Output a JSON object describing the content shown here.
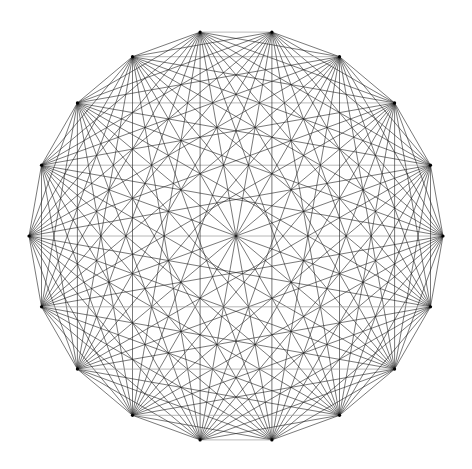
{
  "figure": {
    "kind": "complete-graph",
    "title": "",
    "caption": "",
    "background_color": "#ffffff",
    "width": 472,
    "height": 469
  },
  "chart_data": {
    "type": "scatter",
    "title": "",
    "subtitle": "",
    "xlabel": "",
    "ylabel": "",
    "grid": false,
    "legend": null,
    "annotations": [],
    "graph": {
      "name": "K18",
      "vertex_count": 18,
      "edge_count": 153,
      "layout": "circular",
      "complete": true,
      "center_x": 236,
      "center_y": 236,
      "radius": 207,
      "start_angle_deg": 0,
      "angle_step_deg": 20,
      "angles_deg": [
        0,
        20,
        40,
        60,
        80,
        100,
        120,
        140,
        160,
        180,
        200,
        220,
        240,
        260,
        280,
        300,
        320,
        340
      ],
      "vertex_labels": [
        "0",
        "1",
        "2",
        "3",
        "4",
        "5",
        "6",
        "7",
        "8",
        "9",
        "10",
        "11",
        "12",
        "13",
        "14",
        "15",
        "16",
        "17"
      ],
      "vertices": [
        {
          "id": 0,
          "angle_deg": 0,
          "x": 443.0,
          "y": 236.0
        },
        {
          "id": 1,
          "angle_deg": 20,
          "x": 430.5,
          "y": 165.2
        },
        {
          "id": 2,
          "angle_deg": 40,
          "x": 394.6,
          "y": 102.9
        },
        {
          "id": 3,
          "angle_deg": 60,
          "x": 339.5,
          "y": 56.7
        },
        {
          "id": 4,
          "angle_deg": 80,
          "x": 271.9,
          "y": 32.1
        },
        {
          "id": 5,
          "angle_deg": 100,
          "x": 200.1,
          "y": 32.1
        },
        {
          "id": 6,
          "angle_deg": 120,
          "x": 132.5,
          "y": 56.7
        },
        {
          "id": 7,
          "angle_deg": 140,
          "x": 77.4,
          "y": 102.9
        },
        {
          "id": 8,
          "angle_deg": 160,
          "x": 41.5,
          "y": 165.2
        },
        {
          "id": 9,
          "angle_deg": 180,
          "x": 29.0,
          "y": 236.0
        },
        {
          "id": 10,
          "angle_deg": 200,
          "x": 41.5,
          "y": 306.8
        },
        {
          "id": 11,
          "angle_deg": 220,
          "x": 77.4,
          "y": 369.1
        },
        {
          "id": 12,
          "angle_deg": 240,
          "x": 132.5,
          "y": 415.3
        },
        {
          "id": 13,
          "angle_deg": 260,
          "x": 200.1,
          "y": 439.9
        },
        {
          "id": 14,
          "angle_deg": 280,
          "x": 271.9,
          "y": 439.9
        },
        {
          "id": 15,
          "angle_deg": 300,
          "x": 339.5,
          "y": 415.3
        },
        {
          "id": 16,
          "angle_deg": 320,
          "x": 394.6,
          "y": 369.1
        },
        {
          "id": 17,
          "angle_deg": 340,
          "x": 430.5,
          "y": 306.8
        }
      ]
    }
  },
  "style": {
    "edge_color": "#1a1a1a",
    "edge_width": 0.62,
    "edge_opacity": 0.95,
    "horizontal_edge_color": "#9a9a9a",
    "horizontal_edge_width": 0.75,
    "vertex_color": "#000000",
    "vertex_radius": 1.6,
    "background_color": "#ffffff"
  }
}
